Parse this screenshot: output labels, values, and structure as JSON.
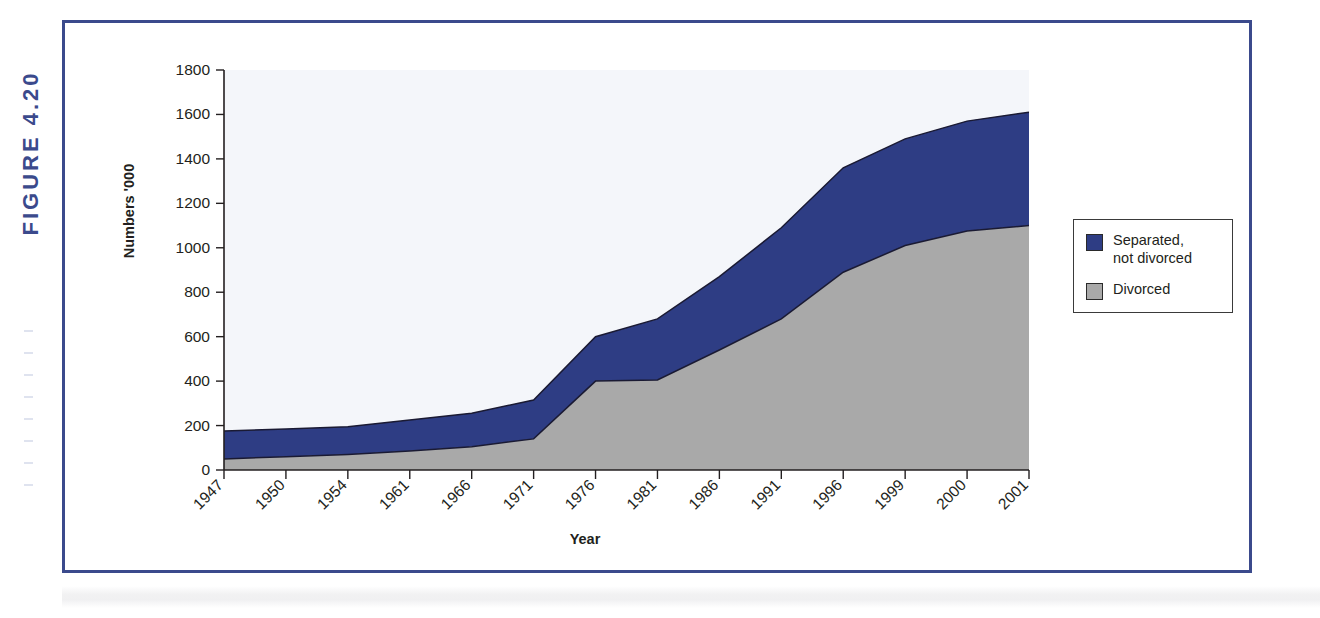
{
  "figure": {
    "number_label": "FIGURE 4.20"
  },
  "axes": {
    "y_title": "Numbers '000",
    "x_title": "Year",
    "y_ticks": [
      0,
      200,
      400,
      600,
      800,
      1000,
      1200,
      1400,
      1600,
      1800
    ],
    "y_min": 0,
    "y_max": 1800
  },
  "legend": {
    "position": "right",
    "items": [
      {
        "label": "Separated,\nnot divorced",
        "color": "#2e3d84",
        "key": "separated"
      },
      {
        "label": "Divorced",
        "color": "#a9a9a9",
        "key": "divorced"
      }
    ]
  },
  "colors": {
    "separated_blue": "#2e3d84",
    "divorced_grey": "#a9a9a9",
    "frame_blue": "#3b4a8c",
    "plot_bg": "#f4f6fa",
    "axis_black": "#231f20",
    "outline": "#1a1a33"
  },
  "chart_data": {
    "type": "area",
    "stacked": true,
    "title": "",
    "subtitle": "",
    "xlabel": "Year",
    "ylabel": "Numbers '000",
    "ylim": [
      0,
      1800
    ],
    "ytick_step": 200,
    "grid": false,
    "legend_position": "right",
    "categories": [
      "1947",
      "1950",
      "1954",
      "1961",
      "1966",
      "1971",
      "1976",
      "1981",
      "1986",
      "1991",
      "1996",
      "1999",
      "2000",
      "2001"
    ],
    "series": [
      {
        "name": "Divorced",
        "color": "#a9a9a9",
        "values": [
          50,
          60,
          70,
          85,
          105,
          140,
          400,
          405,
          540,
          680,
          890,
          1010,
          1075,
          1100
        ]
      },
      {
        "name": "Separated, not divorced",
        "color": "#2e3d84",
        "values": [
          125,
          125,
          125,
          140,
          150,
          175,
          200,
          275,
          330,
          410,
          470,
          480,
          495,
          510
        ]
      }
    ],
    "cumulative_totals": [
      175,
      185,
      195,
      225,
      255,
      315,
      600,
      680,
      870,
      1090,
      1360,
      1490,
      1570,
      1610
    ],
    "annotations": []
  }
}
